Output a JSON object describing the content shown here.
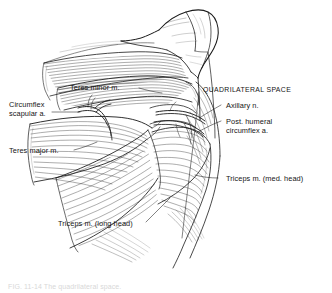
{
  "figure": {
    "background_color": "#ffffff",
    "ink_color": "#1a1a1a",
    "label_color": "#151515",
    "caption": "FIG. 11-14  The quadrilateral space.",
    "caption_color": "#d8d8d8"
  },
  "labels": {
    "teres_minor": "Teres minor m.",
    "quadrilateral_space": "QUADRILATERAL SPACE",
    "circumflex_scapular_line1": "Circumflex",
    "circumflex_scapular_line2": "scapular a.",
    "axillary_nerve": "Axillary n.",
    "post_humeral_line1": "Post. humeral",
    "post_humeral_line2": "circumflex a.",
    "teres_major": "Teres major m.",
    "triceps_medial_head": "Triceps m. (med. head)",
    "triceps_long_head": "Triceps m. (long head)"
  }
}
